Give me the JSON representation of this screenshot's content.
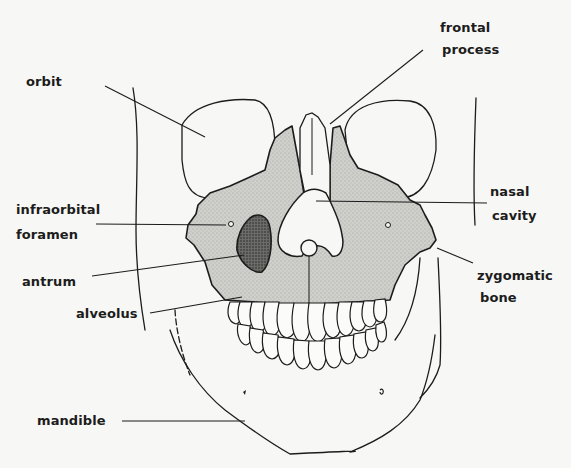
{
  "diagram": {
    "colors": {
      "ink": "#1c1c1c",
      "bone_shade": "#c9c9c6",
      "paper": "#f7f7f5"
    },
    "labels": {
      "orbit": "orbit",
      "frontal_process_1": "frontal",
      "frontal_process_2": "process",
      "nasal_cavity_1": "nasal",
      "nasal_cavity_2": "cavity",
      "infraorbital_foramen_1": "infraorbital",
      "infraorbital_foramen_2": "foramen",
      "antrum": "antrum",
      "alveolus": "alveolus",
      "zygomatic_bone_1": "zygomatic",
      "zygomatic_bone_2": "bone",
      "mandible": "mandible"
    }
  }
}
